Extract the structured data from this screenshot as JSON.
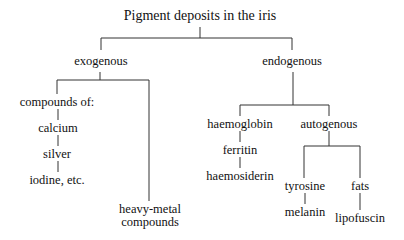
{
  "diagram": {
    "title": "Pigment deposits in the iris",
    "type": "tree",
    "nodes": {
      "root": "Pigment deposits in the iris",
      "exogenous": "exogenous",
      "endogenous": "endogenous",
      "compounds_of": "compounds of:",
      "calcium": "calcium",
      "silver": "silver",
      "iodine": "iodine, etc.",
      "heavy_metal_1": "heavy-metal",
      "heavy_metal_2": "compounds",
      "haemoglobin": "haemoglobin",
      "ferritin": "ferritin",
      "haemosiderin": "haemosiderin",
      "autogenous": "autogenous",
      "tyrosine": "tyrosine",
      "melanin": "melanin",
      "fats": "fats",
      "lipofuscin": "lipofuscin"
    },
    "edges": [
      [
        "root",
        "exogenous"
      ],
      [
        "root",
        "endogenous"
      ],
      [
        "exogenous",
        "compounds_of"
      ],
      [
        "exogenous",
        "heavy-metal compounds"
      ],
      [
        "compounds_of",
        "calcium"
      ],
      [
        "calcium",
        "silver"
      ],
      [
        "silver",
        "iodine"
      ],
      [
        "endogenous",
        "haemoglobin"
      ],
      [
        "endogenous",
        "autogenous"
      ],
      [
        "haemoglobin",
        "ferritin"
      ],
      [
        "ferritin",
        "haemosiderin"
      ],
      [
        "autogenous",
        "tyrosine"
      ],
      [
        "autogenous",
        "fats"
      ],
      [
        "tyrosine",
        "melanin"
      ],
      [
        "fats",
        "lipofuscin"
      ]
    ]
  }
}
